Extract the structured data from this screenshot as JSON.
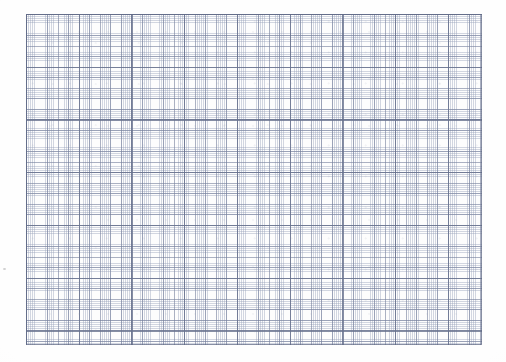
{
  "document": {
    "kind": "graph-paper-scan",
    "title": "Blank graph paper sheet",
    "has_text": false,
    "has_plotted_data": false,
    "annotations": [],
    "width_px": 506,
    "height_px": 362
  },
  "page": {
    "background_color": "#ffffff",
    "paper_color": "#fefefe",
    "margin_note": ""
  },
  "grid": {
    "label": "Ruled grid block",
    "left_px": 26,
    "top_px": 14,
    "width_px": 456,
    "height_px": 331,
    "fill_color": "#fdfdfd",
    "border_color": "#606a86",
    "minor": {
      "label": "minor-gridlines",
      "pitch_px": 2.11,
      "color": "#96a0b9",
      "line_width_px": 0.6
    },
    "medium": {
      "label": "medium-gridlines",
      "pitch_px": 10.55,
      "color": "#78829e",
      "line_width_px": 0.85,
      "minor_cells_per_medium": 5
    },
    "major": {
      "label": "major-gridlines",
      "pitch_px": 52.75,
      "color": "#68728e",
      "line_width_px": 1.1,
      "medium_cells_per_major": 5
    },
    "counts": {
      "major_columns": 9,
      "major_rows": 7,
      "medium_columns": 43,
      "medium_rows": 31
    }
  },
  "artifacts": {
    "vignette_color": "#f0efec",
    "speck_color": "#aaaaac",
    "speck_left_x_px": 3,
    "speck_left_y_px": 268
  }
}
